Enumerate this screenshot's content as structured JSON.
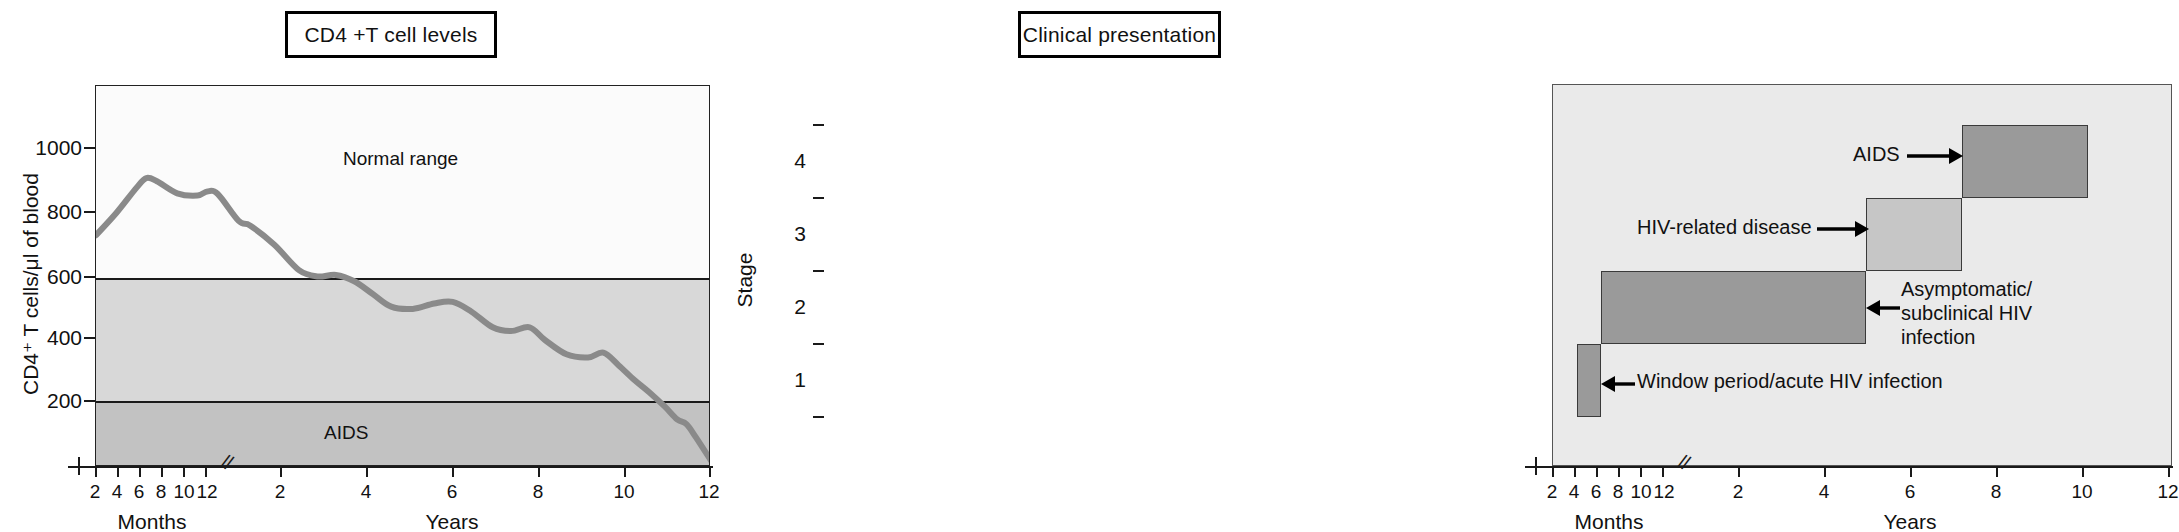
{
  "figure": {
    "panels": [
      {
        "id": "cd4",
        "title": "CD4 +T cell levels",
        "ylabel": "CD4⁺ T cells/μl of blood",
        "xlabel_months": "Months",
        "xlabel_years": "Years",
        "bands": [
          {
            "name": "Normal range",
            "label": "Normal range"
          },
          {
            "name": "intermediate",
            "label": ""
          },
          {
            "name": "AIDS",
            "label": "AIDS"
          }
        ]
      },
      {
        "id": "clinical",
        "title": "Clinical presentation",
        "ylabel": "Stage",
        "xlabel_months": "Months",
        "xlabel_years": "Years",
        "annotations": [
          {
            "name": "aids",
            "text": "AIDS"
          },
          {
            "name": "hiv-related-disease",
            "text": "HIV-related disease"
          },
          {
            "name": "asymptomatic",
            "line1": "Asymptomatic/",
            "line2": "subclinical HIV",
            "line3": "infection"
          },
          {
            "name": "window-period",
            "text": "Window period/acute HIV infection"
          }
        ]
      }
    ]
  },
  "chart_data": [
    {
      "type": "line",
      "id": "cd4-t-cell-levels",
      "title": "CD4 +T cell levels",
      "xlabel": "Months / Years",
      "ylabel": "CD4⁺ T cells/μl of blood",
      "ylim": [
        0,
        1200
      ],
      "yticks": [
        200,
        400,
        600,
        800,
        1000
      ],
      "ytick_labels": [
        "200",
        "400",
        "600",
        "800",
        "1000"
      ],
      "x_month_ticks": [
        2,
        4,
        6,
        8,
        10,
        12
      ],
      "x_month_tick_labels": [
        "2",
        "4",
        "6",
        "8",
        "10",
        "12"
      ],
      "x_year_ticks": [
        2,
        4,
        6,
        8,
        10,
        12
      ],
      "x_year_tick_labels": [
        "2",
        "4",
        "6",
        "8",
        "10",
        "12"
      ],
      "axis_break": true,
      "grid": false,
      "legend": "none",
      "bands": [
        {
          "label": "Normal range",
          "y_from": 600,
          "y_to": 1200,
          "color": "#fbfbfb"
        },
        {
          "label": "",
          "y_from": 200,
          "y_to": 600,
          "color": "#d8d8d8"
        },
        {
          "label": "AIDS",
          "y_from": 0,
          "y_to": 200,
          "color": "#c2c2c2"
        }
      ],
      "series": [
        {
          "name": "CD4 count",
          "color": "#8a8a8a",
          "points": [
            {
              "x_label": "0 mo",
              "x_frac": 0.0,
              "y": 730
            },
            {
              "x_label": "2 mo",
              "x_frac": 0.033,
              "y": 800
            },
            {
              "x_label": "4 mo",
              "x_frac": 0.066,
              "y": 880
            },
            {
              "x_label": "5 mo",
              "x_frac": 0.082,
              "y": 910
            },
            {
              "x_label": "6 mo",
              "x_frac": 0.099,
              "y": 900
            },
            {
              "x_label": "8 mo",
              "x_frac": 0.132,
              "y": 862
            },
            {
              "x_label": "10 mo",
              "x_frac": 0.165,
              "y": 855
            },
            {
              "x_label": "11 mo",
              "x_frac": 0.181,
              "y": 868
            },
            {
              "x_label": "12 mo",
              "x_frac": 0.198,
              "y": 860
            },
            {
              "x_label": "1.2 yr",
              "x_frac": 0.232,
              "y": 775
            },
            {
              "x_label": "1.4 yr",
              "x_frac": 0.251,
              "y": 760
            },
            {
              "x_label": "1.7 yr",
              "x_frac": 0.29,
              "y": 700
            },
            {
              "x_label": "2 yr",
              "x_frac": 0.33,
              "y": 620
            },
            {
              "x_label": "2.3 yr",
              "x_frac": 0.36,
              "y": 600
            },
            {
              "x_label": "2.6 yr",
              "x_frac": 0.39,
              "y": 605
            },
            {
              "x_label": "3 yr",
              "x_frac": 0.42,
              "y": 585
            },
            {
              "x_label": "3.4 yr",
              "x_frac": 0.45,
              "y": 545
            },
            {
              "x_label": "3.8 yr",
              "x_frac": 0.48,
              "y": 505
            },
            {
              "x_label": "4.2 yr",
              "x_frac": 0.515,
              "y": 498
            },
            {
              "x_label": "4.6 yr",
              "x_frac": 0.55,
              "y": 515
            },
            {
              "x_label": "5 yr",
              "x_frac": 0.58,
              "y": 520
            },
            {
              "x_label": "5.4 yr",
              "x_frac": 0.61,
              "y": 490
            },
            {
              "x_label": "5.8 yr",
              "x_frac": 0.645,
              "y": 440
            },
            {
              "x_label": "6.2 yr",
              "x_frac": 0.675,
              "y": 428
            },
            {
              "x_label": "6.6 yr",
              "x_frac": 0.705,
              "y": 440
            },
            {
              "x_label": "7 yr",
              "x_frac": 0.73,
              "y": 400
            },
            {
              "x_label": "7.5 yr",
              "x_frac": 0.765,
              "y": 355
            },
            {
              "x_label": "8 yr",
              "x_frac": 0.8,
              "y": 345
            },
            {
              "x_label": "8.4 yr",
              "x_frac": 0.825,
              "y": 360
            },
            {
              "x_label": "8.8 yr",
              "x_frac": 0.85,
              "y": 320
            },
            {
              "x_label": "9.2 yr",
              "x_frac": 0.875,
              "y": 275
            },
            {
              "x_label": "9.6 yr",
              "x_frac": 0.9,
              "y": 235
            },
            {
              "x_label": "10 yr",
              "x_frac": 0.925,
              "y": 190
            },
            {
              "x_label": "10.6 yr",
              "x_frac": 0.945,
              "y": 150
            },
            {
              "x_label": "11 yr",
              "x_frac": 0.96,
              "y": 135
            },
            {
              "x_label": "11.4 yr",
              "x_frac": 0.975,
              "y": 95
            },
            {
              "x_label": "12 yr",
              "x_frac": 1.0,
              "y": 20
            }
          ]
        }
      ]
    },
    {
      "type": "bar",
      "id": "clinical-presentation",
      "title": "Clinical presentation",
      "xlabel": "Months / Years",
      "ylabel": "Stage",
      "ylim": [
        0,
        5
      ],
      "yticks": [
        1,
        2,
        3,
        4
      ],
      "ytick_labels": [
        "1",
        "2",
        "3",
        "4"
      ],
      "x_month_ticks": [
        2,
        4,
        6,
        8,
        10,
        12
      ],
      "x_month_tick_labels": [
        "2",
        "4",
        "6",
        "8",
        "10",
        "12"
      ],
      "x_year_ticks": [
        2,
        4,
        6,
        8,
        10,
        12
      ],
      "x_year_tick_labels": [
        "2",
        "4",
        "6",
        "8",
        "10",
        "12"
      ],
      "axis_break": true,
      "grid": false,
      "legend": "none",
      "bars": [
        {
          "label": "Window period/acute HIV infection",
          "stage": 1,
          "start_label": "2 months",
          "end_label": "4 months",
          "color": "#9a9a9a"
        },
        {
          "label": "Asymptomatic/subclinical HIV infection",
          "stage": 2,
          "start_label": "4 months",
          "end_label": "8 years",
          "color": "#9a9a9a"
        },
        {
          "label": "HIV-related disease",
          "stage": 3,
          "start_label": "8 years",
          "end_label": "10.5 years",
          "color": "#c6c6c6"
        },
        {
          "label": "AIDS",
          "stage": 4,
          "start_label": "10.5 years",
          "end_label": "12 years",
          "color": "#9a9a9a"
        }
      ]
    }
  ]
}
